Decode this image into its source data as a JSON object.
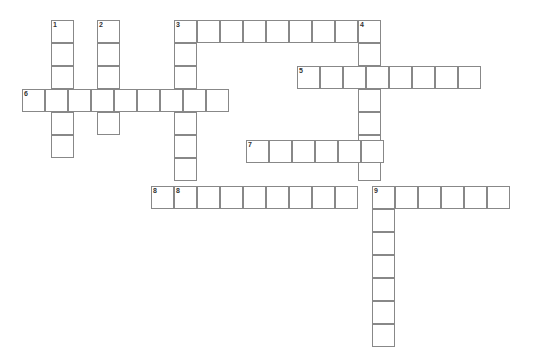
{
  "puzzle": {
    "type": "crossword-grid",
    "title": "",
    "grid": {
      "cell_size": 23,
      "origin_x": 22,
      "origin_y": 20,
      "columns": 23,
      "rows": 14,
      "line_color": "#888888",
      "cell_fill": "#ffffff",
      "background": "#ffffff"
    },
    "entries": [
      {
        "number": "1",
        "direction": "down",
        "col": 1,
        "row": 0,
        "length": 6
      },
      {
        "number": "2",
        "direction": "down",
        "col": 3,
        "row": 0,
        "length": 5
      },
      {
        "number": "3",
        "direction": "across",
        "col": 6,
        "row": 0,
        "length": 8
      },
      {
        "number": "3",
        "direction": "down",
        "col": 6,
        "row": 0,
        "length": 9
      },
      {
        "number": "4",
        "direction": "down",
        "col": 15,
        "row": 0,
        "length": 8
      },
      {
        "number": "5",
        "direction": "across",
        "col": 12,
        "row": 2,
        "length": 8
      },
      {
        "number": "6",
        "across": true,
        "direction": "across",
        "col": 0,
        "row": 3,
        "length": 9
      },
      {
        "number": "7",
        "direction": "across",
        "col": 10,
        "row": 5,
        "length": 6
      },
      {
        "number": "8",
        "direction": "across",
        "col": 5,
        "row": 7,
        "length": 9
      },
      {
        "number": "9",
        "direction": "across",
        "col": 15,
        "row": 7,
        "length": 6
      },
      {
        "number": "9",
        "direction": "down",
        "col": 15,
        "row": 7,
        "length": 7
      }
    ],
    "cells": [
      {
        "x": 51,
        "y": 20,
        "number": "1"
      },
      {
        "x": 51,
        "y": 43,
        "number": ""
      },
      {
        "x": 51,
        "y": 66,
        "number": ""
      },
      {
        "x": 51,
        "y": 89,
        "number": ""
      },
      {
        "x": 51,
        "y": 112,
        "number": ""
      },
      {
        "x": 51,
        "y": 135,
        "number": ""
      },
      {
        "x": 97,
        "y": 20,
        "number": "2"
      },
      {
        "x": 97,
        "y": 43,
        "number": ""
      },
      {
        "x": 97,
        "y": 66,
        "number": ""
      },
      {
        "x": 97,
        "y": 89,
        "number": ""
      },
      {
        "x": 97,
        "y": 112,
        "number": ""
      },
      {
        "x": 174,
        "y": 20,
        "number": "3"
      },
      {
        "x": 197,
        "y": 20,
        "number": ""
      },
      {
        "x": 220,
        "y": 20,
        "number": ""
      },
      {
        "x": 243,
        "y": 20,
        "number": ""
      },
      {
        "x": 266,
        "y": 20,
        "number": ""
      },
      {
        "x": 289,
        "y": 20,
        "number": ""
      },
      {
        "x": 312,
        "y": 20,
        "number": ""
      },
      {
        "x": 335,
        "y": 20,
        "number": ""
      },
      {
        "x": 358,
        "y": 20,
        "number": "4"
      },
      {
        "x": 174,
        "y": 43,
        "number": ""
      },
      {
        "x": 174,
        "y": 66,
        "number": ""
      },
      {
        "x": 174,
        "y": 89,
        "number": ""
      },
      {
        "x": 174,
        "y": 112,
        "number": ""
      },
      {
        "x": 174,
        "y": 135,
        "number": ""
      },
      {
        "x": 174,
        "y": 158,
        "number": ""
      },
      {
        "x": 174,
        "y": 186,
        "number": "8"
      },
      {
        "x": 358,
        "y": 43,
        "number": ""
      },
      {
        "x": 358,
        "y": 66,
        "number": ""
      },
      {
        "x": 358,
        "y": 89,
        "number": ""
      },
      {
        "x": 358,
        "y": 112,
        "number": ""
      },
      {
        "x": 358,
        "y": 135,
        "number": ""
      },
      {
        "x": 358,
        "y": 158,
        "number": ""
      },
      {
        "x": 297,
        "y": 66,
        "number": "5"
      },
      {
        "x": 320,
        "y": 66,
        "number": ""
      },
      {
        "x": 343,
        "y": 66,
        "number": ""
      },
      {
        "x": 366,
        "y": 66,
        "number": ""
      },
      {
        "x": 389,
        "y": 66,
        "number": ""
      },
      {
        "x": 412,
        "y": 66,
        "number": ""
      },
      {
        "x": 435,
        "y": 66,
        "number": ""
      },
      {
        "x": 458,
        "y": 66,
        "number": ""
      },
      {
        "x": 22,
        "y": 89,
        "number": "6"
      },
      {
        "x": 45,
        "y": 89,
        "number": ""
      },
      {
        "x": 68,
        "y": 89,
        "number": ""
      },
      {
        "x": 91,
        "y": 89,
        "number": ""
      },
      {
        "x": 114,
        "y": 89,
        "number": ""
      },
      {
        "x": 137,
        "y": 89,
        "number": ""
      },
      {
        "x": 160,
        "y": 89,
        "number": ""
      },
      {
        "x": 183,
        "y": 89,
        "number": ""
      },
      {
        "x": 206,
        "y": 89,
        "number": ""
      },
      {
        "x": 246,
        "y": 140,
        "number": "7"
      },
      {
        "x": 269,
        "y": 140,
        "number": ""
      },
      {
        "x": 292,
        "y": 140,
        "number": ""
      },
      {
        "x": 315,
        "y": 140,
        "number": ""
      },
      {
        "x": 338,
        "y": 140,
        "number": ""
      },
      {
        "x": 361,
        "y": 140,
        "number": ""
      },
      {
        "x": 151,
        "y": 186,
        "number": "8"
      },
      {
        "x": 197,
        "y": 186,
        "number": ""
      },
      {
        "x": 220,
        "y": 186,
        "number": ""
      },
      {
        "x": 243,
        "y": 186,
        "number": ""
      },
      {
        "x": 266,
        "y": 186,
        "number": ""
      },
      {
        "x": 289,
        "y": 186,
        "number": ""
      },
      {
        "x": 312,
        "y": 186,
        "number": ""
      },
      {
        "x": 335,
        "y": 186,
        "number": ""
      },
      {
        "x": 372,
        "y": 186,
        "number": "9"
      },
      {
        "x": 395,
        "y": 186,
        "number": ""
      },
      {
        "x": 418,
        "y": 186,
        "number": ""
      },
      {
        "x": 441,
        "y": 186,
        "number": ""
      },
      {
        "x": 464,
        "y": 186,
        "number": ""
      },
      {
        "x": 487,
        "y": 186,
        "number": ""
      },
      {
        "x": 372,
        "y": 209,
        "number": ""
      },
      {
        "x": 372,
        "y": 232,
        "number": ""
      },
      {
        "x": 372,
        "y": 255,
        "number": ""
      },
      {
        "x": 372,
        "y": 278,
        "number": ""
      },
      {
        "x": 372,
        "y": 301,
        "number": ""
      },
      {
        "x": 372,
        "y": 324,
        "number": ""
      }
    ]
  }
}
